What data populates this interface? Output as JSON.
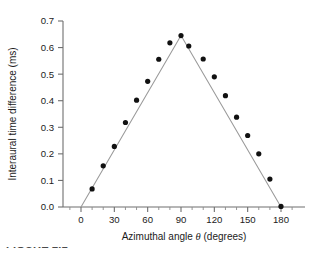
{
  "figure": {
    "caption_partial": "FIGURE 2.1",
    "background": "#ffffff"
  },
  "chart_data": {
    "type": "scatter",
    "title": "",
    "subtitle": "",
    "xlabel": "Azimuthal angle θ (degrees)",
    "xlabel_prefix": "Azimuthal angle ",
    "xlabel_symbol": "θ",
    "xlabel_suffix": " (degrees)",
    "ylabel": "Interaural time difference (ms)",
    "xlim": [
      -15,
      200
    ],
    "ylim": [
      0.0,
      0.7
    ],
    "xticks": [
      0,
      30,
      60,
      90,
      120,
      150,
      180
    ],
    "xticklabels": [
      "0",
      "30",
      "60",
      "90",
      "120",
      "150",
      "180"
    ],
    "xticks_minor": [
      -10,
      10,
      20,
      40,
      50,
      70,
      80,
      100,
      110,
      130,
      140,
      160,
      170,
      190
    ],
    "yticks": [
      0.0,
      0.1,
      0.2,
      0.3,
      0.4,
      0.5,
      0.6,
      0.7
    ],
    "yticklabels": [
      "0.0",
      "0.1",
      "0.2",
      "0.3",
      "0.4",
      "0.5",
      "0.6",
      "0.7"
    ],
    "grid": false,
    "legend": null,
    "marker_color": "#111111",
    "line_color": "#9a9a9a",
    "axis_color": "#6f6f6f",
    "series": [
      {
        "name": "measured interaural time difference",
        "type": "scatter",
        "marker": "filled-circle",
        "x": [
          10,
          20,
          30,
          40,
          50,
          60,
          70,
          80,
          90,
          97,
          110,
          120,
          130,
          140,
          150,
          160,
          170,
          180
        ],
        "y": [
          0.068,
          0.155,
          0.228,
          0.318,
          0.402,
          0.473,
          0.556,
          0.618,
          0.645,
          0.606,
          0.557,
          0.49,
          0.419,
          0.338,
          0.269,
          0.2,
          0.105,
          0.002
        ]
      },
      {
        "name": "model fit",
        "type": "line",
        "x": [
          0,
          90,
          180
        ],
        "y": [
          0.0,
          0.645,
          0.0
        ]
      }
    ]
  }
}
